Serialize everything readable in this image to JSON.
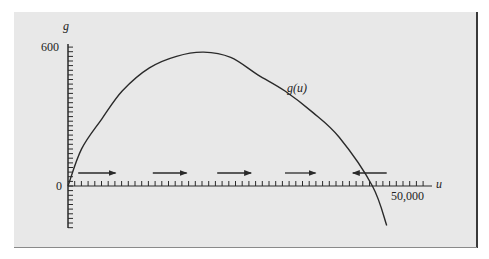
{
  "chart_data": {
    "type": "line",
    "title": "",
    "xlabel": "u",
    "ylabel": "g",
    "series": [
      {
        "name": "g(u)",
        "x": [
          0,
          2000,
          5000,
          8000,
          12000,
          16000,
          20000,
          24000,
          28000,
          32000,
          36000,
          40000,
          44900,
          47000
        ],
        "values": [
          0,
          160,
          290,
          410,
          510,
          560,
          578,
          555,
          480,
          410,
          320,
          210,
          0,
          -170
        ]
      }
    ],
    "xlim": [
      0,
      55000
    ],
    "ylim": [
      -170,
      620
    ],
    "x_ticks_labeled": [
      {
        "value": 0,
        "label": "0"
      },
      {
        "value": 50000,
        "label": "50,000"
      }
    ],
    "y_ticks_labeled": [
      {
        "value": 0,
        "label": "0"
      },
      {
        "value": 600,
        "label": "600"
      }
    ],
    "annotations": [
      {
        "text": "g(u)",
        "type": "curve-label"
      },
      {
        "type": "arrow",
        "direction": "right",
        "u_range": [
          1500,
          7000
        ]
      },
      {
        "type": "arrow",
        "direction": "right",
        "u_range": [
          12500,
          17500
        ]
      },
      {
        "type": "arrow",
        "direction": "right",
        "u_range": [
          22000,
          27000
        ]
      },
      {
        "type": "arrow",
        "direction": "right",
        "u_range": [
          32000,
          36500
        ]
      },
      {
        "type": "arrow",
        "direction": "left",
        "u_range": [
          42000,
          47000
        ]
      }
    ],
    "grid": false,
    "legend": "none"
  },
  "labels": {
    "y_axis": "g",
    "x_axis": "u",
    "y_600": "600",
    "origin": "0",
    "x_50000": "50,000",
    "curve": "g(u)"
  },
  "colors": {
    "panel_bg": "#e8e8e8",
    "ink": "#2a2a2a"
  }
}
